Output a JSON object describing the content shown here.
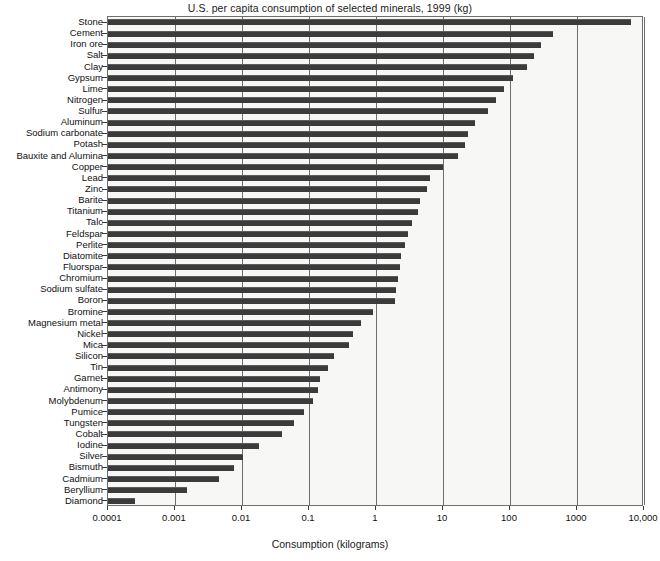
{
  "chart_data": {
    "type": "bar",
    "orientation": "horizontal",
    "title": "U.S. per capita consumption of selected minerals, 1999 (kg)",
    "xlabel": "Consumption (kilograms)",
    "ylabel": "",
    "xscale": "log",
    "xlim": [
      0.0001,
      10000
    ],
    "xticks": [
      0.0001,
      0.001,
      0.01,
      0.1,
      1,
      10,
      100,
      1000,
      10000
    ],
    "xticklabels": [
      "0.0001",
      "0.001",
      "0.01",
      "0.1",
      "1",
      "10",
      "100",
      "1000",
      "10,000"
    ],
    "grid": true,
    "legend": false,
    "bar_color": "#3b3b3b",
    "categories": [
      "Stone",
      "Cement",
      "Iron ore",
      "Salt",
      "Clay",
      "Gypsum",
      "Lime",
      "Nitrogen",
      "Sulfur",
      "Aluminum",
      "Sodium carbonate",
      "Potash",
      "Bauxite and Alumina",
      "Copper",
      "Lead",
      "Zinc",
      "Barite",
      "Titanium",
      "Talc",
      "Feldspar",
      "Perlite",
      "Diatomite",
      "Fluorspar",
      "Chromium",
      "Sodium sulfate",
      "Boron",
      "Bromine",
      "Magnesium metal",
      "Nickel",
      "Mica",
      "Silicon",
      "Tin",
      "Garnet",
      "Antimony",
      "Molybdenum",
      "Pumice",
      "Tungsten",
      "Cobalt",
      "Iodine",
      "Silver",
      "Bismuth",
      "Cadmium",
      "Beryllium",
      "Diamond"
    ],
    "values": [
      6500,
      440,
      290,
      230,
      180,
      110,
      80,
      62,
      47,
      30,
      24,
      21,
      17,
      10,
      6.5,
      5.8,
      4.6,
      4.2,
      3.5,
      3.0,
      2.7,
      2.4,
      2.3,
      2.1,
      2.0,
      1.9,
      0.9,
      0.6,
      0.45,
      0.4,
      0.24,
      0.19,
      0.145,
      0.135,
      0.115,
      0.085,
      0.06,
      0.039,
      0.018,
      0.0105,
      0.0075,
      0.0046,
      0.0015,
      0.00025
    ]
  }
}
